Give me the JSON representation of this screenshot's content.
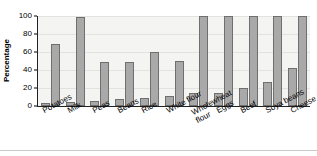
{
  "chart_data": {
    "type": "bar",
    "title": "",
    "xlabel": "",
    "ylabel": "Percentage",
    "ylim": [
      0,
      100
    ],
    "yticks": [
      0,
      20,
      40,
      60,
      80,
      100
    ],
    "grid": true,
    "legend": "none",
    "categories": [
      "Potatoes",
      "Milk",
      "Peas",
      "Beans",
      "Rice",
      "White flour",
      "Wholewheat flour",
      "Eggs",
      "Beef",
      "Soya beans",
      "Cheese"
    ],
    "series": [
      {
        "name": "Lower value",
        "values": [
          3,
          4,
          6,
          8,
          9,
          11,
          14,
          15,
          20,
          27,
          42
        ]
      },
      {
        "name": "Upper value",
        "values": [
          69,
          99,
          49,
          49,
          60,
          50,
          100,
          100,
          100,
          100,
          100
        ]
      }
    ],
    "bar_color": "#a9a9a9",
    "bar_border_color": "#6f6f6f",
    "plot_background": "#f4f4f2",
    "axis_color": "#222222"
  },
  "axis": {
    "y_title": "Percentage",
    "y_ticks": [
      "100",
      "80",
      "60",
      "40",
      "20",
      "0"
    ]
  },
  "x_axis": {
    "labels": [
      {
        "text": "Potatoes",
        "two_line": false
      },
      {
        "text": "Milk",
        "two_line": false
      },
      {
        "text": "Peas",
        "two_line": false
      },
      {
        "text": "Beans",
        "two_line": false
      },
      {
        "text": "Rice",
        "two_line": false
      },
      {
        "text": "White flour",
        "two_line": false
      },
      {
        "text": "Wholewheat flour",
        "two_line": true
      },
      {
        "text": "Eggs",
        "two_line": false
      },
      {
        "text": "Beef",
        "two_line": false
      },
      {
        "text": "Soya beans",
        "two_line": false
      },
      {
        "text": "Cheese",
        "two_line": false
      }
    ]
  }
}
